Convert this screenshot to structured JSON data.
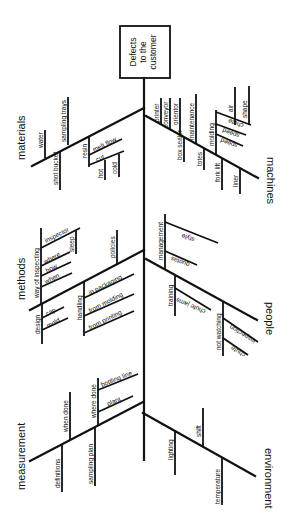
{
  "diagram": {
    "type": "fishbone",
    "orientation": "rotated 90deg (head at top)",
    "effect": [
      "Defects",
      "to the",
      "customer"
    ],
    "categories": {
      "materials": {
        "label": "materials",
        "causes": [
          "water",
          "shot bucket",
          "sampling trays",
          "resin"
        ],
        "resin_sub": [
          "melt flow",
          "cut",
          "hot",
          "cold"
        ]
      },
      "machines": {
        "label": "machines",
        "causes": [
          "printer",
          "conveyor",
          "orientor",
          "box sealer",
          "maintenance",
          "totes",
          "molding",
          "fork lift",
          "liner",
          "air",
          "shape"
        ],
        "molding_sub": [
          "chute",
          "speed",
          "speed"
        ]
      },
      "methods": {
        "label": "methods",
        "causes": [
          "way of inspecting",
          "design",
          "handling",
          "policies"
        ],
        "way_of_inspecting_sub": [
          "inspector",
          "sleep",
          "where",
          "how",
          "when"
        ],
        "design_sub": [
          "cap",
          "mold"
        ],
        "handling_sub": [
          "in packaging",
          "from molding",
          "from printing"
        ]
      },
      "people": {
        "label": "people",
        "causes": [
          "management",
          "training",
          "not watching"
        ],
        "management_sub": [
          "style",
          "quotas"
        ],
        "training_sub": [
          "chute jams"
        ],
        "not_watching_sub": [
          "inspection",
          "chute"
        ]
      },
      "measurement": {
        "label": "measurement",
        "causes": [
          "definitions",
          "when done",
          "sampling plan",
          "where done"
        ],
        "where_done_sub": [
          "bottling line",
          "plant"
        ]
      },
      "environment": {
        "label": "environment",
        "causes": [
          "lighting",
          "shift",
          "temperature"
        ]
      }
    }
  }
}
